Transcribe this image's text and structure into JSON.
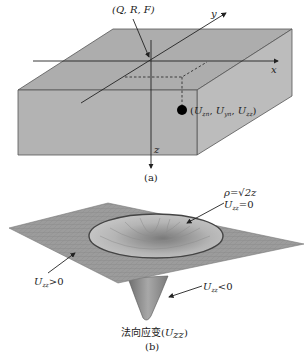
{
  "figure_a": {
    "caption": "(a)",
    "origin_label": "(Q, R, F)",
    "axis_x": "x",
    "axis_y": "y",
    "axis_z": "z",
    "point_label": "(U",
    "point_label_full": "(Uzn, Uyn, Uzz)",
    "point_parts": {
      "u1": "U",
      "s1": "zn",
      "u2": "U",
      "s2": "yn",
      "u3": "U",
      "s3": "zz"
    },
    "colors": {
      "box_front": "#b4b4b4",
      "box_top": "#ababab",
      "box_side": "#bdbdbd",
      "edge": "#555555",
      "point": "#000000"
    }
  },
  "figure_b": {
    "caption": "(b)",
    "title_cn": "法向应变",
    "title_var": "U",
    "title_sub": "zz",
    "ring_label_line1": "ρ=√2z",
    "ring_label_line2": {
      "u": "U",
      "sub": "zz",
      "rest": "=0"
    },
    "positive_label": {
      "u": "U",
      "sub": "zz",
      "rest": ">0"
    },
    "negative_label": {
      "u": "U",
      "sub": "zz",
      "rest": "<0"
    },
    "colors": {
      "surface": "#9a9a9a",
      "mesh": "#7a7a7a",
      "funnel": "#8c8c8c",
      "ring": "#444444"
    }
  }
}
